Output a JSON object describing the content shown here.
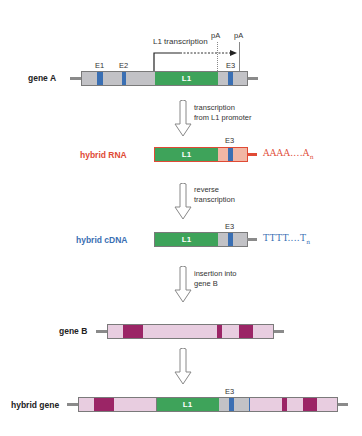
{
  "colors": {
    "gray_exon_bg": "#c2c2c6",
    "exon_blue": "#3a6fb3",
    "l1_green": "#3ea35a",
    "l1_border": "#2e7a45",
    "rna_red": "#e04a35",
    "rna_pink": "#f1b7a5",
    "cdna_blue": "#3a6fb3",
    "geneb_pink": "#e8cde0",
    "geneb_maroon": "#9b2566",
    "outline": "#7a7a7a"
  },
  "gene_a": {
    "label": "gene A",
    "exons": [
      "E1",
      "E2",
      "E3"
    ],
    "l1_label": "L1",
    "transcription_label": "L1 transcription",
    "pa_labels": [
      "pA",
      "pA"
    ]
  },
  "steps": [
    {
      "lines": [
        "transcription",
        "from L1 promoter"
      ]
    },
    {
      "lines": [
        "reverse",
        "transcription"
      ]
    },
    {
      "lines": [
        "insertion into",
        "gene B"
      ]
    }
  ],
  "hybrid_rna": {
    "label": "hybrid RNA",
    "l1_label": "L1",
    "exon_label": "E3",
    "tail": "AAAA....A",
    "tail_sub": "n"
  },
  "hybrid_cdna": {
    "label": "hybrid cDNA",
    "l1_label": "L1",
    "exon_label": "E3",
    "tail": "TTTT....T",
    "tail_sub": "n"
  },
  "gene_b": {
    "label": "gene B"
  },
  "hybrid_gene": {
    "label": "hybrid gene",
    "l1_label": "L1",
    "exon_label": "E3"
  }
}
